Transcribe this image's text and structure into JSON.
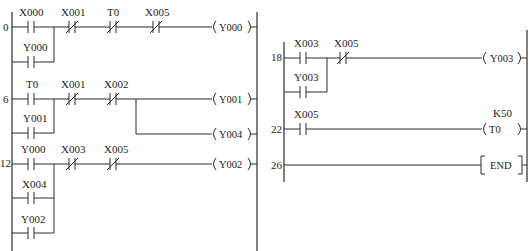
{
  "diagram": {
    "type": "PLC ladder diagram",
    "left_panel": {
      "rungs": [
        {
          "step": "0",
          "contacts": [
            {
              "label": "X000",
              "type": "NO"
            },
            {
              "label": "X001",
              "type": "NC"
            },
            {
              "label": "T0",
              "type": "NC"
            },
            {
              "label": "X005",
              "type": "NC"
            }
          ],
          "parallel": [
            {
              "label": "Y000",
              "type": "NO"
            }
          ],
          "outputs": [
            {
              "label": "Y000",
              "type": "coil"
            }
          ]
        },
        {
          "step": "6",
          "contacts": [
            {
              "label": "T0",
              "type": "NO"
            },
            {
              "label": "X001",
              "type": "NC"
            },
            {
              "label": "X002",
              "type": "NC"
            }
          ],
          "parallel": [
            {
              "label": "Y001",
              "type": "NO"
            }
          ],
          "outputs": [
            {
              "label": "Y001",
              "type": "coil"
            },
            {
              "label": "Y004",
              "type": "coil"
            }
          ]
        },
        {
          "step": "12",
          "contacts": [
            {
              "label": "Y000",
              "type": "NO"
            },
            {
              "label": "X003",
              "type": "NC"
            },
            {
              "label": "X005",
              "type": "NC"
            }
          ],
          "parallel": [
            {
              "label": "X004",
              "type": "NO"
            },
            {
              "label": "Y002",
              "type": "NO"
            }
          ],
          "outputs": [
            {
              "label": "Y002",
              "type": "coil"
            }
          ]
        }
      ]
    },
    "right_panel": {
      "rungs": [
        {
          "step": "18",
          "contacts": [
            {
              "label": "X003",
              "type": "NO"
            },
            {
              "label": "X005",
              "type": "NC"
            }
          ],
          "parallel": [
            {
              "label": "Y003",
              "type": "NO"
            }
          ],
          "outputs": [
            {
              "label": "Y003",
              "type": "coil"
            }
          ]
        },
        {
          "step": "22",
          "contacts": [
            {
              "label": "X005",
              "type": "NO"
            }
          ],
          "parallel": [],
          "outputs": [
            {
              "label": "T0",
              "type": "timer",
              "preset": "K50"
            }
          ]
        },
        {
          "step": "26",
          "contacts": [],
          "parallel": [],
          "outputs": [
            {
              "label": "END",
              "type": "instruction"
            }
          ]
        }
      ]
    }
  }
}
